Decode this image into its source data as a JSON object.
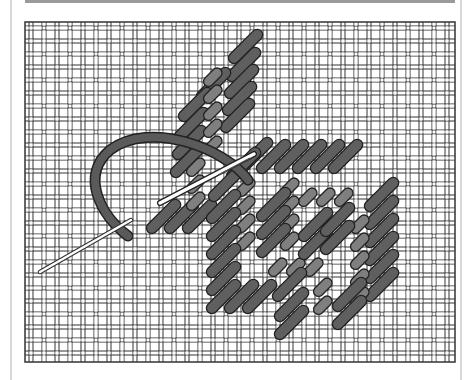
{
  "figure": {
    "type": "needlepoint-stitch-illustration",
    "colors": {
      "background": "#ffffff",
      "canvas_thread": "#ffffff",
      "canvas_outline": "#333333",
      "stitch_dark": "#5f5f5f",
      "stitch_light": "#7f7f7f",
      "stitch_outline": "#222222",
      "yarn": "#5a5a5a",
      "needle": "#ffffff",
      "frame": "#d8d8d8",
      "top_bar": "#9a9a9a"
    },
    "canvas": {
      "x": 25,
      "y": 22,
      "width": 430,
      "height": 340,
      "cell": 13
    },
    "elements": [
      "woven-canvas",
      "stitched-area",
      "yarn-strand",
      "needle",
      "tail-needle"
    ]
  }
}
